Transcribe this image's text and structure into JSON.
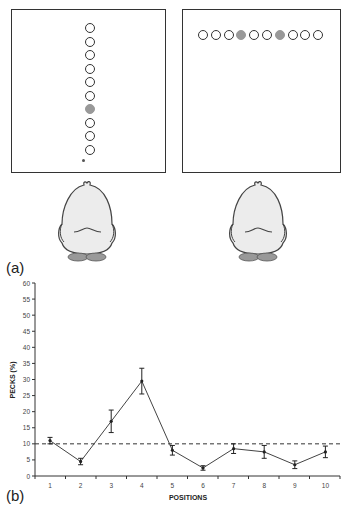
{
  "panels": {
    "label_a": "(a)",
    "label_b": "(b)",
    "left": {
      "orientation": "vertical",
      "disk_count": 10,
      "filled_indices": [
        6
      ]
    },
    "right": {
      "orientation": "horizontal",
      "disk_count": 10,
      "filled_indices": [
        3,
        6
      ]
    }
  },
  "chart_data": {
    "type": "line",
    "title": "",
    "xlabel": "POSITIONS",
    "ylabel": "PECKS (%)",
    "categories": [
      "1",
      "2",
      "3",
      "4",
      "5",
      "6",
      "7",
      "8",
      "9",
      "10"
    ],
    "series": [
      {
        "name": "Pecks",
        "values": [
          11,
          4.5,
          17,
          29.5,
          8,
          2.5,
          8.5,
          7.5,
          3.5,
          7.5
        ],
        "error": [
          1,
          1,
          3.5,
          4,
          1.5,
          0.7,
          1.5,
          2,
          1.2,
          1.8
        ]
      }
    ],
    "reference_line": {
      "y": 10,
      "style": "dashed"
    },
    "ylim": [
      0,
      60
    ],
    "yticks": [
      0,
      5,
      10,
      15,
      20,
      25,
      30,
      35,
      40,
      45,
      50,
      55,
      60
    ],
    "grid": false,
    "legend": null
  }
}
